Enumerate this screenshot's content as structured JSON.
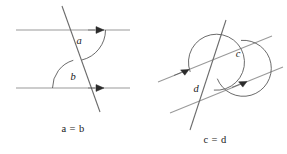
{
  "figure": {
    "background_color": "#ffffff",
    "line_color": "#9a9a9a",
    "transversal_color": "#6b6b6b",
    "arc_color": "#5a5a5a",
    "marker_color": "#2b2b2b",
    "text_color": "#1a1a1a"
  },
  "left_diagram": {
    "name": "corresponding-angles",
    "caption": "a = b",
    "angles": [
      {
        "id": "a",
        "label": "a"
      },
      {
        "id": "b",
        "label": "b"
      }
    ],
    "parallel_lines": [
      {
        "id": "upper",
        "y": 30,
        "x1": 16,
        "x2": 130,
        "marker_x": 98,
        "marker_dir": "right"
      },
      {
        "id": "lower",
        "y": 88,
        "x1": 16,
        "x2": 130,
        "marker_x": 98,
        "marker_dir": "right"
      }
    ],
    "transversal": {
      "x1": 62,
      "y1": 6,
      "x2": 100,
      "y2": 112
    }
  },
  "right_diagram": {
    "name": "alternate-angles",
    "caption": "c = d",
    "angles": [
      {
        "id": "c",
        "label": "c"
      },
      {
        "id": "d",
        "label": "d"
      }
    ],
    "parallel_lines": [
      {
        "id": "upper",
        "x1": 158,
        "y1": 82,
        "x2": 272,
        "y2": 36,
        "marker_t": 0.4,
        "marker_dir": "up-right"
      },
      {
        "id": "lower",
        "x1": 170,
        "y1": 113,
        "x2": 283,
        "y2": 67,
        "marker_t": 0.62,
        "marker_dir": "up-right"
      }
    ],
    "transversal": {
      "x1": 226,
      "y1": 20,
      "x2": 190,
      "y2": 130
    }
  },
  "icons": {
    "direction_marker": "arrow-right-marker"
  }
}
